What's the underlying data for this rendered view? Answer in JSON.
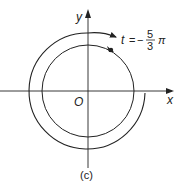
{
  "diagram": {
    "caption": "(c)",
    "axes": {
      "x_label": "x",
      "y_label": "y",
      "origin_label": "O"
    },
    "annotation": {
      "variable": "t",
      "equals": "=",
      "sign": "−",
      "numerator": "5",
      "denominator": "3",
      "pi": "π"
    },
    "elements": {
      "unit_circle": "circle-centered-at-origin",
      "spiral_arrow": "clockwise-arc-arrow-from-positive-x-axis",
      "terminal_point": "dot-on-circle"
    },
    "colors": {
      "stroke": "#222222",
      "background": "#ffffff"
    }
  }
}
